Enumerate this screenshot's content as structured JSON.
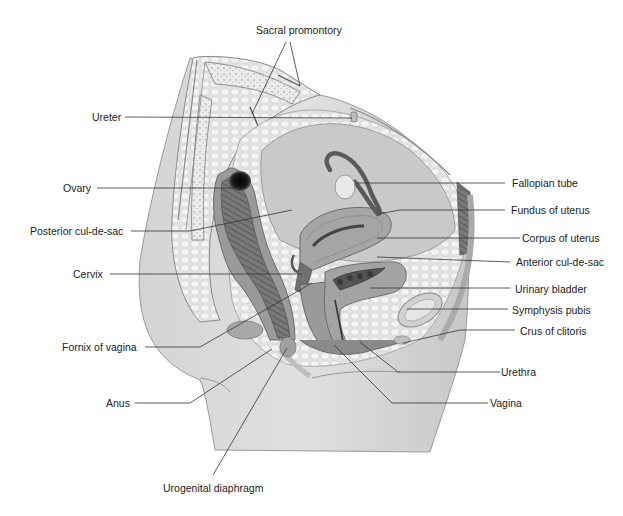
{
  "diagram": {
    "colors": {
      "background": "#ffffff",
      "skin": "#d9d9d9",
      "skin_shadow": "#bdbdbd",
      "bone": "#e6e6e6",
      "bone_outline": "#8a8a8a",
      "fat": "#efefef",
      "peritoneum": "#c4c4c4",
      "organ_dark": "#5a5a5a",
      "organ_mid": "#8d8d8d",
      "organ_light": "#b5b5b5",
      "leader_line": "#333333"
    },
    "labels": {
      "sacral_promontory": "Sacral promontory",
      "ureter": "Ureter",
      "ovary": "Ovary",
      "posterior_cul_de_sac": "Posterior cul-de-sac",
      "cervix": "Cervix",
      "fornix_of_vagina": "Fornix of vagina",
      "anus": "Anus",
      "urogenital_diaphragm": "Urogenital diaphragm",
      "fallopian_tube": "Fallopian tube",
      "fundus_of_uterus": "Fundus of uterus",
      "corpus_of_uterus": "Corpus of uterus",
      "anterior_cul_de_sac": "Anterior cul-de-sac",
      "urinary_bladder": "Urinary bladder",
      "symphysis_pubis": "Symphysis pubis",
      "crus_of_clitoris": "Crus of clitoris",
      "urethra": "Urethra",
      "vagina": "Vagina"
    }
  }
}
